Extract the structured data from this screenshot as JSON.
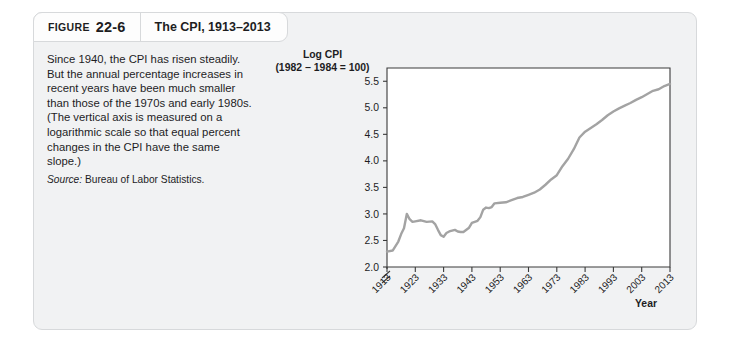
{
  "figure": {
    "label": "FIGURE",
    "number": "22-6",
    "title": "The CPI, 1913–2013"
  },
  "caption": {
    "body": "Since 1940, the CPI has risen steadily. But the annual percentage increases in recent years have been much smaller than those of the 1970s and early 1980s. (The vertical axis is measured on a logarithmic scale so that equal percent changes in the CPI have the same slope.)",
    "source_lead": "Source:",
    "source_text": " Bureau of Labor Statistics."
  },
  "colors": {
    "card_background": "#f1f2f3",
    "card_border": "#d7d9db",
    "header_background": "#fdfdfd",
    "plot_background": "#ffffff",
    "line": "#a3a3a3",
    "axis": "#3a3a3a",
    "text": "#1d1d1f"
  },
  "chart_data": {
    "type": "line",
    "title": "The CPI, 1913–2013",
    "ylabel_line1": "Log CPI",
    "ylabel_line2": "(1982 − 1984 = 100)",
    "xlabel": "Year",
    "grid": false,
    "legend": false,
    "axis_break_y": true,
    "ylim": [
      2.0,
      5.75
    ],
    "yticks": [
      "2.0",
      "2.5",
      "3.0",
      "3.5",
      "4.0",
      "4.5",
      "5.0",
      "5.5"
    ],
    "ytick_values": [
      2.0,
      2.5,
      3.0,
      3.5,
      4.0,
      4.5,
      5.0,
      5.5
    ],
    "xlim": [
      1913,
      2013
    ],
    "xticks": [
      "1913",
      "1923",
      "1933",
      "1943",
      "1953",
      "1963",
      "1973",
      "1983",
      "1993",
      "2003",
      "2013"
    ],
    "xtick_values": [
      1913,
      1923,
      1933,
      1943,
      1953,
      1963,
      1973,
      1983,
      1993,
      2003,
      2013
    ],
    "series": [
      {
        "name": "Log CPI (1982–1984 = 100)",
        "x": [
          1913,
          1915,
          1917,
          1918,
          1919,
          1920,
          1921,
          1922,
          1923,
          1925,
          1927,
          1929,
          1930,
          1931,
          1932,
          1933,
          1934,
          1935,
          1937,
          1938,
          1939,
          1940,
          1942,
          1943,
          1945,
          1946,
          1947,
          1948,
          1949,
          1950,
          1951,
          1953,
          1955,
          1957,
          1959,
          1961,
          1963,
          1965,
          1967,
          1969,
          1971,
          1973,
          1975,
          1977,
          1979,
          1981,
          1983,
          1985,
          1987,
          1989,
          1991,
          1993,
          1995,
          1997,
          1999,
          2001,
          2003,
          2005,
          2007,
          2009,
          2011,
          2013
        ],
        "y": [
          2.29,
          2.31,
          2.48,
          2.62,
          2.73,
          3.0,
          2.9,
          2.85,
          2.86,
          2.88,
          2.85,
          2.86,
          2.81,
          2.7,
          2.6,
          2.57,
          2.64,
          2.67,
          2.7,
          2.67,
          2.66,
          2.66,
          2.74,
          2.83,
          2.87,
          2.94,
          3.08,
          3.12,
          3.11,
          3.13,
          3.2,
          3.21,
          3.22,
          3.26,
          3.3,
          3.32,
          3.36,
          3.4,
          3.46,
          3.55,
          3.65,
          3.73,
          3.9,
          4.04,
          4.22,
          4.44,
          4.55,
          4.62,
          4.69,
          4.77,
          4.86,
          4.93,
          4.99,
          5.04,
          5.09,
          5.15,
          5.2,
          5.26,
          5.32,
          5.35,
          5.41,
          5.45
        ]
      }
    ],
    "annotations": []
  }
}
